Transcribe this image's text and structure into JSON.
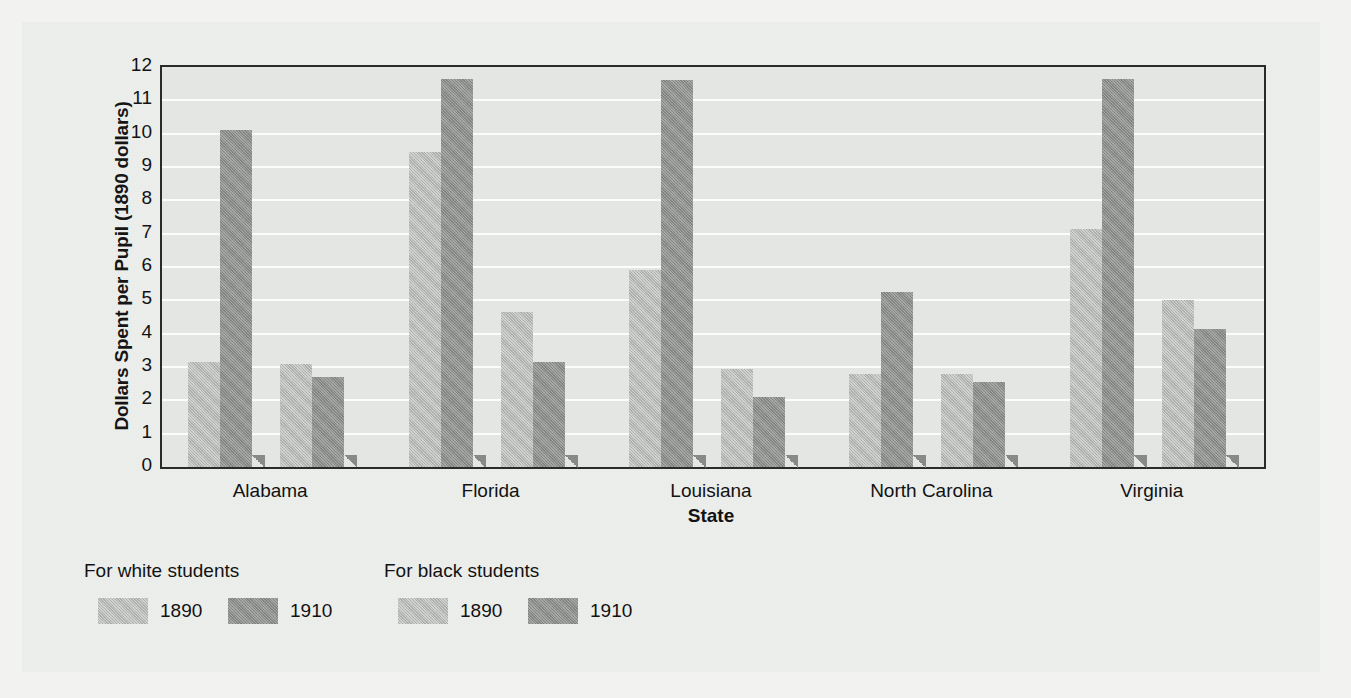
{
  "chart_data": {
    "type": "bar",
    "title": "",
    "xlabel": "State",
    "ylabel": "Dollars Spent per Pupil (1890 dollars)",
    "categories": [
      "Alabama",
      "Florida",
      "Louisiana",
      "North Carolina",
      "Virginia"
    ],
    "ylim": [
      0,
      12
    ],
    "yticks": [
      "0",
      "1",
      "2",
      "3",
      "4",
      "5",
      "6",
      "7",
      "8",
      "9",
      "10",
      "11",
      "12"
    ],
    "grid": true,
    "legend_position": "below-left",
    "series": [
      {
        "name": "For white students 1890",
        "group": "For white students",
        "year": "1890",
        "color": "#b4b6b4",
        "values": [
          3.15,
          9.45,
          5.9,
          2.8,
          7.15
        ]
      },
      {
        "name": "For white students 1910",
        "group": "For white students",
        "year": "1910",
        "color": "#8a8c8a",
        "values": [
          10.1,
          11.65,
          11.6,
          5.25,
          11.65
        ]
      },
      {
        "name": "For black students 1890",
        "group": "For black students",
        "year": "1890",
        "color": "#b4b6b4",
        "values": [
          3.1,
          4.65,
          2.95,
          2.8,
          5.0
        ]
      },
      {
        "name": "For black students 1910",
        "group": "For black students",
        "year": "1910",
        "color": "#8a8c8a",
        "values": [
          2.7,
          3.15,
          2.1,
          2.55,
          4.15
        ]
      }
    ]
  },
  "legend": {
    "groups": [
      {
        "title": "For white students",
        "entries": [
          {
            "label": "1890",
            "swatch": "light-gray-swatch"
          },
          {
            "label": "1910",
            "swatch": "dark-gray-swatch"
          }
        ]
      },
      {
        "title": "For black students",
        "entries": [
          {
            "label": "1890",
            "swatch": "light-gray-swatch"
          },
          {
            "label": "1910",
            "swatch": "dark-gray-swatch"
          }
        ]
      }
    ]
  },
  "colors": {
    "series_1890": "#b4b6b4",
    "series_1910": "#8a8c8a",
    "plot_background": "#e4e6e4",
    "gridline": "#fbfcfb",
    "axis": "#2a2a2a",
    "page": "#eceeec"
  }
}
